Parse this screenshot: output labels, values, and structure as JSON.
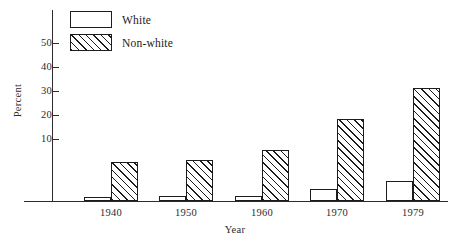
{
  "chart_data": {
    "type": "bar",
    "title": "",
    "xlabel": "Year",
    "ylabel": "Percent",
    "categories": [
      "1940",
      "1950",
      "1960",
      "1970",
      "1979"
    ],
    "series": [
      {
        "name": "White",
        "values": [
          1.5,
          2,
          2,
          5,
          8
        ]
      },
      {
        "name": "Non-white",
        "values": [
          16,
          17,
          21,
          33.5,
          46.5
        ]
      }
    ],
    "ylim": [
      0,
      57
    ],
    "yticks": [
      10,
      20,
      30,
      40,
      50
    ],
    "ytick_labels": [
      "10",
      "20",
      "30",
      "40",
      "50"
    ],
    "grid": false,
    "legend_position": "top-left",
    "legend": [
      "White",
      "Non-white"
    ]
  },
  "axes": {
    "y_title": "Percent",
    "x_title": "Year",
    "y_tick_labels": [
      "50",
      "40",
      "30",
      "20",
      "10"
    ],
    "x_tick_labels": [
      "1940",
      "1950",
      "1960",
      "1970",
      "1979"
    ]
  },
  "legend": {
    "items": [
      {
        "label": "White",
        "swatch": "empty-box"
      },
      {
        "label": "Non-white",
        "swatch": "hatched-box"
      }
    ]
  }
}
